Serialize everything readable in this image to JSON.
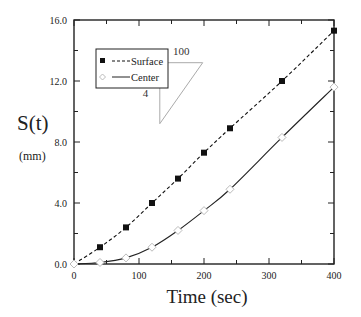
{
  "chart_data": {
    "type": "line",
    "title": "",
    "xlabel": "Time (sec)",
    "ylabel": "S(t)",
    "ylabel_unit": "(mm)",
    "xlim": [
      0,
      400
    ],
    "ylim": [
      0,
      16
    ],
    "x_ticks": [
      0,
      100,
      200,
      300,
      400
    ],
    "x_tick_labels": [
      "0",
      "100",
      "200",
      "300",
      "400"
    ],
    "x_minor_ticks": [
      50,
      150,
      250,
      350
    ],
    "y_ticks": [
      0,
      4,
      8,
      12,
      16
    ],
    "y_tick_labels": [
      "0.0",
      "4.0",
      "8.0",
      "12.0",
      "16.0"
    ],
    "y_minor_ticks": [
      2,
      6,
      10,
      14
    ],
    "grid": false,
    "legend_position": "upper left",
    "series": [
      {
        "name": "Surface",
        "line_style": "dashed",
        "marker": "filled-square",
        "x": [
          0,
          40,
          80,
          120,
          160,
          200,
          240,
          320,
          400
        ],
        "y": [
          0.0,
          1.1,
          2.4,
          4.0,
          5.6,
          7.3,
          8.9,
          12.0,
          15.3
        ]
      },
      {
        "name": "Center",
        "line_style": "solid",
        "marker": "open-diamond",
        "x": [
          0,
          40,
          80,
          120,
          160,
          200,
          240,
          320,
          400
        ],
        "y": [
          0.0,
          0.1,
          0.4,
          1.1,
          2.2,
          3.5,
          4.9,
          8.3,
          11.6
        ]
      }
    ],
    "annotations": [
      {
        "type": "slope-triangle",
        "run_label": "100",
        "rise_label": "4",
        "x0": 132,
        "y0": 9.2,
        "x1": 198,
        "y1": 13.2
      }
    ]
  },
  "legend": {
    "items": [
      {
        "label": "Surface"
      },
      {
        "label": "Center"
      }
    ]
  },
  "colors": {
    "axis": "#222222",
    "surface": "#111111",
    "center": "#222222",
    "center_marker_edge": "#bbbbbb",
    "triangle": "#aaaaaa"
  }
}
